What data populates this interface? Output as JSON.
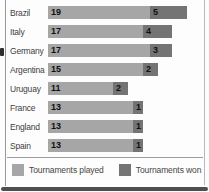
{
  "chart_data": {
    "type": "bar",
    "orientation": "horizontal",
    "title": "",
    "categories": [
      "Brazil",
      "Italy",
      "Germany",
      "Argentina",
      "Uruguay",
      "France",
      "England",
      "Spain"
    ],
    "series": [
      {
        "name": "Tournaments played",
        "values": [
          19,
          17,
          17,
          15,
          11,
          13,
          13,
          13
        ],
        "color": "#a6a6a6"
      },
      {
        "name": "Tournaments won",
        "values": [
          5,
          4,
          3,
          2,
          2,
          1,
          1,
          1
        ],
        "color": "#747474"
      }
    ],
    "xlim": [
      0,
      19
    ],
    "grid": false,
    "legend_position": "bottom",
    "value_labels": "inside-left"
  },
  "colors": {
    "played_bar": "#a6a6a6",
    "won_bar": "#747474",
    "number_text": "#101010",
    "label_text": "#3e3e3e",
    "divider": "#9c9c9c",
    "bottom_edge": "#4e4e4e"
  }
}
